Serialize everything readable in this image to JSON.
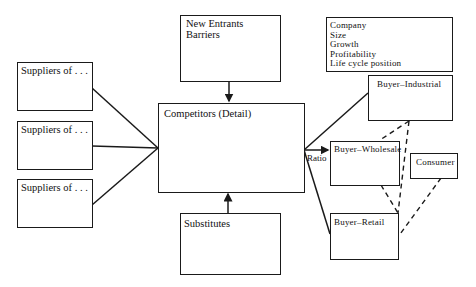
{
  "diagram": {
    "suppliers": [
      {
        "label": "Suppliers of . . ."
      },
      {
        "label": "Suppliers of . . ."
      },
      {
        "label": "Suppliers of . . ."
      }
    ],
    "new_entrants": {
      "line1": "New Entrants",
      "line2": "Barriers"
    },
    "competitors": {
      "label": "Competitors (Detail)"
    },
    "substitutes": {
      "label": "Substitutes"
    },
    "attributes": {
      "items": [
        "Company",
        "Size",
        "Growth",
        "Profitability",
        "Life cycle position"
      ]
    },
    "buyers": {
      "industrial": "Buyer–Industrial",
      "wholesale": "Buyer–Wholesale",
      "retail": "Buyer–Retail",
      "consumer": "Consumer"
    },
    "ratio_label": "Ratio",
    "colors": {
      "line": "#1a1a1a",
      "background": "#ffffff"
    }
  }
}
